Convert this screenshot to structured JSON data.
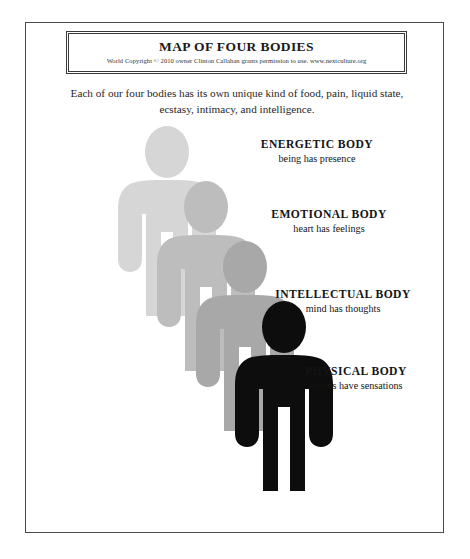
{
  "document": {
    "title": "MAP OF FOUR BODIES",
    "copyright": "World Copyright © 2010 owner Clinton Callahan grants permission to use. www.nextculture.org",
    "intro": "Each of our four bodies has its own unique kind of food, pain, liquid state, ecstasy, intimacy, and intelligence."
  },
  "bodies": [
    {
      "id": "energetic",
      "title": "ENERGETIC BODY",
      "subtitle": "being has presence",
      "color": "#d6d6d6",
      "figure": {
        "x": 108,
        "y": 128
      }
    },
    {
      "id": "emotional",
      "title": "EMOTIONAL BODY",
      "subtitle": "heart has feelings",
      "color": "#bdbdbd",
      "figure": {
        "x": 147,
        "y": 183
      }
    },
    {
      "id": "intellectual",
      "title": "INTELLECTUAL BODY",
      "subtitle": "mind has thoughts",
      "color": "#a8a8a8",
      "figure": {
        "x": 186,
        "y": 243
      }
    },
    {
      "id": "physical",
      "title": "PHYSICAL BODY",
      "subtitle": "organs have sensations",
      "color": "#0d0d0d",
      "figure": {
        "x": 225,
        "y": 303
      }
    }
  ],
  "figure_geometry": {
    "width": 118,
    "height": 188,
    "description": "human pictogram: oval head, rounded torso with shoulders, arms at sides, two legs"
  },
  "colors": {
    "page_background": "#ffffff",
    "frame_border": "#4a4a4a",
    "title_border": "#3a3a3a",
    "text": "#1a1a1a"
  }
}
